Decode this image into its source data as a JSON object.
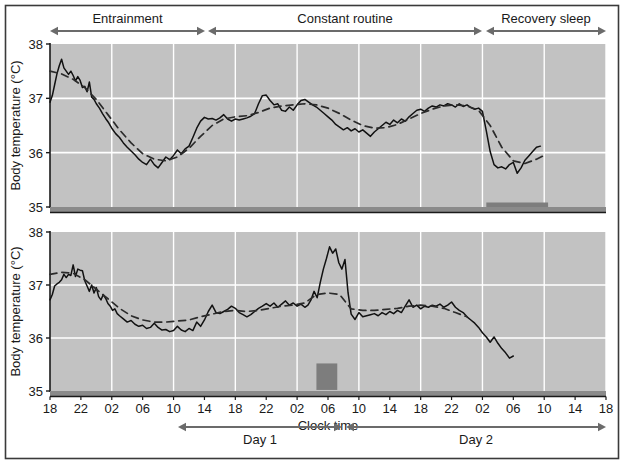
{
  "figure": {
    "border_color": "#3a3a3a",
    "background": "#ffffff",
    "panel_fill": "#c2c2c2",
    "grid_color": "#ffffff",
    "trace_color": "#111111",
    "fit_color": "#2b2b2b",
    "arrow_color": "#6b6b6b",
    "sleepbar_color": "#7d7d7d"
  },
  "phases": [
    {
      "label": "Entrainment",
      "x_start": 50,
      "x_end": 205
    },
    {
      "label": "Constant routine",
      "x_start": 208,
      "x_end": 482
    },
    {
      "label": "Recovery sleep",
      "x_start": 486,
      "x_end": 606
    }
  ],
  "days": [
    {
      "label": "Day 1",
      "x_start": 178,
      "x_end": 342
    },
    {
      "label": "Day 2",
      "x_start": 346,
      "x_end": 606
    }
  ],
  "axis": {
    "ylabel": "Body temperature (°C)",
    "xlabel": "Clock time",
    "yticks": [
      "38",
      "37",
      "36",
      "35"
    ],
    "xticks": [
      "18",
      "22",
      "02",
      "06",
      "10",
      "14",
      "18",
      "22",
      "02",
      "06",
      "10",
      "14",
      "18",
      "22",
      "02",
      "06",
      "10",
      "14",
      "18"
    ]
  },
  "chart_data": [
    {
      "type": "line",
      "panel": "top",
      "title": "",
      "xlabel": "Clock time",
      "ylabel": "Body temperature (°C)",
      "ylim": [
        35,
        38
      ],
      "xlim": [
        18,
        90
      ],
      "grid": true,
      "legend": "none",
      "xtick_values": [
        18,
        22,
        26,
        30,
        34,
        38,
        42,
        46,
        50,
        54,
        58,
        62,
        66,
        70,
        74,
        78,
        82,
        86,
        90
      ],
      "xtick_labels": [
        "18",
        "22",
        "02",
        "06",
        "10",
        "14",
        "18",
        "22",
        "02",
        "06",
        "10",
        "14",
        "18",
        "22",
        "02",
        "06",
        "10",
        "14",
        "18"
      ],
      "ytick_values": [
        35,
        36,
        37,
        38
      ],
      "sleep_bars": [
        {
          "x_start": 74.5,
          "x_end": 82.5,
          "y": 35.02
        }
      ],
      "series": [
        {
          "name": "body temperature (raw)",
          "style": "solid",
          "x": [
            18.0,
            18.3,
            18.6,
            18.9,
            19.2,
            19.5,
            19.8,
            20.1,
            20.4,
            20.7,
            21.0,
            21.3,
            21.6,
            21.9,
            22.2,
            22.5,
            22.8,
            23.1,
            23.4,
            23.7,
            24.0,
            24.4,
            24.8,
            25.2,
            25.6,
            26.0,
            26.5,
            27.0,
            27.5,
            28.0,
            28.5,
            29.0,
            29.5,
            30.0,
            30.5,
            31.0,
            31.5,
            32.0,
            32.5,
            33.0,
            33.5,
            34.0,
            34.5,
            35.0,
            35.5,
            36.0,
            36.5,
            37.0,
            37.5,
            38.0,
            38.5,
            39.0,
            39.5,
            40.0,
            40.5,
            41.0,
            41.5,
            42.0,
            42.5,
            43.0,
            43.5,
            44.0,
            44.5,
            45.0,
            45.5,
            46.0,
            46.5,
            47.0,
            47.5,
            48.0,
            48.5,
            49.0,
            49.5,
            50.0,
            50.5,
            51.0,
            51.5,
            52.0,
            52.5,
            53.0,
            53.5,
            54.0,
            54.5,
            55.0,
            55.5,
            56.0,
            56.5,
            57.0,
            57.5,
            58.0,
            58.5,
            59.0,
            59.5,
            60.0,
            60.5,
            61.0,
            61.5,
            62.0,
            62.5,
            63.0,
            63.5,
            64.0,
            64.5,
            65.0,
            65.5,
            66.0,
            66.5,
            67.0,
            67.5,
            68.0,
            68.5,
            69.0,
            69.5,
            70.0,
            70.5,
            71.0,
            71.5,
            72.0,
            72.5,
            73.0,
            73.5,
            74.0,
            74.5,
            75.0,
            75.5,
            76.0,
            76.5,
            77.0,
            77.5,
            78.0,
            78.5,
            79.0,
            79.5,
            80.0,
            80.5,
            81.0,
            81.5,
            82.0
          ],
          "y": [
            36.93,
            37.05,
            37.25,
            37.45,
            37.6,
            37.72,
            37.56,
            37.5,
            37.44,
            37.5,
            37.42,
            37.32,
            37.4,
            37.33,
            37.2,
            37.22,
            37.12,
            37.3,
            37.02,
            36.98,
            36.9,
            36.82,
            36.72,
            36.63,
            36.55,
            36.45,
            36.35,
            36.28,
            36.18,
            36.1,
            36.03,
            35.96,
            35.88,
            35.82,
            35.78,
            35.88,
            35.78,
            35.72,
            35.82,
            35.92,
            35.87,
            35.95,
            36.05,
            35.98,
            36.07,
            36.12,
            36.28,
            36.45,
            36.58,
            36.65,
            36.62,
            36.63,
            36.6,
            36.64,
            36.7,
            36.62,
            36.58,
            36.62,
            36.6,
            36.62,
            36.64,
            36.67,
            36.72,
            36.9,
            37.05,
            37.06,
            36.96,
            36.88,
            36.9,
            36.78,
            36.76,
            36.84,
            36.78,
            36.88,
            36.96,
            36.98,
            36.93,
            36.88,
            36.84,
            36.78,
            36.72,
            36.66,
            36.6,
            36.52,
            36.47,
            36.42,
            36.46,
            36.4,
            36.44,
            36.38,
            36.42,
            36.36,
            36.3,
            36.38,
            36.44,
            36.5,
            36.56,
            36.52,
            36.6,
            36.55,
            36.62,
            36.58,
            36.66,
            36.72,
            36.78,
            36.8,
            36.76,
            36.82,
            36.86,
            36.84,
            36.88,
            36.86,
            36.9,
            36.88,
            36.84,
            36.9,
            36.85,
            36.88,
            36.83,
            36.8,
            36.82,
            36.76,
            36.4,
            36.02,
            35.78,
            35.72,
            35.74,
            35.7,
            35.78,
            35.82,
            35.62,
            35.72,
            35.86,
            35.94,
            36.02,
            36.1,
            36.12
          ]
        },
        {
          "name": "circadian fit (smoothed)",
          "style": "dashed",
          "x": [
            18.0,
            19.5,
            21.0,
            22.5,
            24.0,
            25.5,
            27.0,
            28.5,
            30.0,
            31.5,
            33.0,
            34.5,
            36.0,
            37.5,
            39.0,
            40.5,
            42.0,
            43.5,
            45.0,
            46.5,
            48.0,
            49.5,
            51.0,
            52.5,
            54.0,
            55.5,
            57.0,
            58.5,
            60.0,
            61.5,
            63.0,
            64.5,
            66.0,
            67.5,
            69.0,
            70.5,
            72.0,
            73.5,
            75.0,
            76.5,
            78.0,
            79.5,
            81.0,
            82.0
          ],
          "y": [
            37.5,
            37.45,
            37.35,
            37.2,
            36.98,
            36.7,
            36.42,
            36.18,
            35.98,
            35.88,
            35.85,
            35.92,
            36.08,
            36.3,
            36.5,
            36.62,
            36.66,
            36.68,
            36.74,
            36.82,
            36.86,
            36.88,
            36.9,
            36.88,
            36.82,
            36.72,
            36.6,
            36.5,
            36.45,
            36.46,
            36.52,
            36.62,
            36.72,
            36.8,
            36.86,
            36.88,
            36.86,
            36.78,
            36.5,
            36.1,
            35.85,
            35.8,
            35.88,
            35.95
          ]
        }
      ]
    },
    {
      "type": "line",
      "panel": "bottom",
      "title": "",
      "xlabel": "Clock time",
      "ylabel": "Body temperature (°C)",
      "ylim": [
        35,
        38
      ],
      "xlim": [
        18,
        90
      ],
      "grid": true,
      "legend": "none",
      "xtick_values": [
        18,
        22,
        26,
        30,
        34,
        38,
        42,
        46,
        50,
        54,
        58,
        62,
        66,
        70,
        74,
        78,
        82,
        86,
        90
      ],
      "xtick_labels": [
        "18",
        "22",
        "02",
        "06",
        "10",
        "14",
        "18",
        "22",
        "02",
        "06",
        "10",
        "14",
        "18",
        "22",
        "02",
        "06",
        "10",
        "14",
        "18"
      ],
      "ytick_values": [
        35,
        36,
        37,
        38
      ],
      "sleep_bars": [
        {
          "x_start": 52.5,
          "x_end": 55.2,
          "y_top": 35.52,
          "y_bottom": 35.02,
          "block": true
        }
      ],
      "series": [
        {
          "name": "body temperature (raw)",
          "style": "solid",
          "x": [
            18.0,
            18.3,
            18.6,
            18.9,
            19.2,
            19.5,
            19.8,
            20.1,
            20.4,
            20.7,
            21.0,
            21.3,
            21.6,
            21.9,
            22.2,
            22.5,
            22.8,
            23.1,
            23.4,
            23.7,
            24.0,
            24.3,
            24.6,
            24.9,
            25.2,
            25.5,
            25.8,
            26.1,
            26.4,
            26.7,
            27.0,
            27.5,
            28.0,
            28.5,
            29.0,
            29.5,
            30.0,
            30.5,
            31.0,
            31.5,
            32.0,
            32.5,
            33.0,
            33.5,
            34.0,
            34.5,
            35.0,
            35.5,
            36.0,
            36.5,
            37.0,
            37.5,
            38.0,
            38.5,
            39.0,
            39.5,
            40.0,
            40.5,
            41.0,
            41.5,
            42.0,
            42.5,
            43.0,
            43.5,
            44.0,
            44.5,
            45.0,
            45.5,
            46.0,
            46.5,
            47.0,
            47.5,
            48.0,
            48.5,
            49.0,
            49.5,
            50.0,
            50.5,
            51.0,
            51.4,
            51.8,
            52.2,
            52.6,
            53.0,
            53.4,
            53.8,
            54.2,
            54.6,
            55.0,
            55.4,
            55.8,
            56.2,
            56.6,
            57.0,
            57.5,
            58.0,
            58.5,
            59.0,
            59.5,
            60.0,
            60.5,
            61.0,
            61.5,
            62.0,
            62.5,
            63.0,
            63.5,
            64.0,
            64.5,
            65.0,
            65.5,
            66.0,
            66.5,
            67.0,
            67.5,
            68.0,
            68.5,
            69.0,
            69.5,
            70.0,
            70.5,
            71.0,
            71.5,
            72.0,
            72.5,
            73.0,
            73.5,
            74.0,
            74.5,
            75.0,
            75.5,
            76.0,
            76.5,
            77.0,
            77.5,
            78.0
          ],
          "y": [
            36.72,
            36.82,
            36.98,
            37.02,
            37.05,
            37.1,
            37.2,
            37.14,
            37.2,
            37.18,
            37.38,
            37.16,
            37.3,
            37.28,
            37.27,
            37.08,
            36.98,
            36.88,
            37.0,
            36.85,
            36.95,
            36.78,
            36.72,
            36.82,
            36.75,
            36.65,
            36.6,
            36.52,
            36.55,
            36.46,
            36.42,
            36.36,
            36.3,
            36.33,
            36.26,
            36.22,
            36.24,
            36.18,
            36.2,
            36.28,
            36.2,
            36.15,
            36.16,
            36.12,
            36.14,
            36.22,
            36.15,
            36.12,
            36.18,
            36.14,
            36.3,
            36.22,
            36.34,
            36.5,
            36.62,
            36.48,
            36.46,
            36.5,
            36.54,
            36.6,
            36.56,
            36.48,
            36.44,
            36.4,
            36.44,
            36.5,
            36.56,
            36.6,
            36.65,
            36.6,
            36.66,
            36.58,
            36.64,
            36.7,
            36.62,
            36.66,
            36.6,
            36.64,
            36.58,
            36.62,
            36.72,
            36.88,
            36.76,
            37.05,
            37.3,
            37.5,
            37.72,
            37.6,
            37.68,
            37.42,
            37.3,
            37.48,
            36.85,
            36.45,
            36.35,
            36.48,
            36.4,
            36.42,
            36.44,
            36.46,
            36.42,
            36.48,
            36.44,
            36.5,
            36.46,
            36.52,
            36.48,
            36.6,
            36.72,
            36.58,
            36.62,
            36.55,
            36.6,
            36.58,
            36.62,
            36.6,
            36.64,
            36.58,
            36.62,
            36.68,
            36.58,
            36.52,
            36.48,
            36.4,
            36.34,
            36.28,
            36.2,
            36.1,
            36.02,
            35.92,
            36.02,
            35.9,
            35.8,
            35.72,
            35.62,
            35.66
          ]
        },
        {
          "name": "circadian fit (smoothed)",
          "style": "dashed",
          "x": [
            18.0,
            19.5,
            21.0,
            22.5,
            24.0,
            25.5,
            27.0,
            28.5,
            30.0,
            31.5,
            33.0,
            34.5,
            36.0,
            37.5,
            39.0,
            40.5,
            42.0,
            43.5,
            45.0,
            46.5,
            48.0,
            49.5,
            51.0,
            52.5,
            54.0,
            55.5,
            57.0,
            58.5,
            60.0,
            61.5,
            63.0,
            64.5,
            66.0,
            67.5,
            69.0,
            70.5,
            72.0
          ],
          "y": [
            37.2,
            37.24,
            37.22,
            37.1,
            36.92,
            36.74,
            36.56,
            36.42,
            36.34,
            36.3,
            36.3,
            36.32,
            36.34,
            36.4,
            36.45,
            36.5,
            36.52,
            36.5,
            36.52,
            36.56,
            36.6,
            36.62,
            36.66,
            36.82,
            36.85,
            36.82,
            36.55,
            36.52,
            36.52,
            36.54,
            36.56,
            36.6,
            36.62,
            36.6,
            36.56,
            36.48,
            36.4
          ]
        }
      ]
    }
  ]
}
